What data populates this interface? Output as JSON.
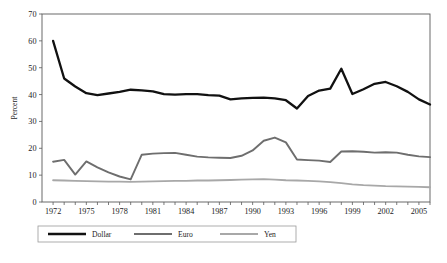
{
  "figure": {
    "caption_fragment": "",
    "background_color": "#ffffff"
  },
  "chart_data": {
    "type": "line",
    "title": "",
    "subtitle": "",
    "xlabel": "",
    "ylabel": "Percent",
    "xlim": [
      1971,
      2006
    ],
    "ylim": [
      0,
      70
    ],
    "ytick_step": 10,
    "yticks": [
      0,
      10,
      20,
      30,
      40,
      50,
      60,
      70
    ],
    "ytick_labels": [
      "0",
      "10",
      "20",
      "30",
      "40",
      "50",
      "60",
      "70"
    ],
    "xticks_all": [
      1972,
      1973,
      1974,
      1975,
      1976,
      1977,
      1978,
      1979,
      1980,
      1981,
      1982,
      1983,
      1984,
      1985,
      1986,
      1987,
      1988,
      1989,
      1990,
      1991,
      1992,
      1993,
      1994,
      1995,
      1996,
      1997,
      1998,
      1999,
      2000,
      2001,
      2002,
      2003,
      2004,
      2005,
      2006
    ],
    "xtick_labels_shown": [
      "1972",
      "1975",
      "1978",
      "1981",
      "1984",
      "1987",
      "1990",
      "1993",
      "1996",
      "1999",
      "2002",
      "2005"
    ],
    "xtick_label_years": [
      1972,
      1975,
      1978,
      1981,
      1984,
      1987,
      1990,
      1993,
      1996,
      1999,
      2002,
      2005
    ],
    "grid": false,
    "legend_position": "below-axes",
    "x": [
      1972,
      1973,
      1974,
      1975,
      1976,
      1977,
      1978,
      1979,
      1980,
      1981,
      1982,
      1983,
      1984,
      1985,
      1986,
      1987,
      1988,
      1989,
      1990,
      1991,
      1992,
      1993,
      1994,
      1995,
      1996,
      1997,
      1998,
      1999,
      2000,
      2001,
      2002,
      2003,
      2004,
      2005,
      2006
    ],
    "series": [
      {
        "name": "Dollar",
        "color": "#111111",
        "width": 2.3,
        "values": [
          60.0,
          46.0,
          43.0,
          40.5,
          39.8,
          40.4,
          41.0,
          41.8,
          41.6,
          41.2,
          40.2,
          40.0,
          40.2,
          40.2,
          39.8,
          39.6,
          38.2,
          38.6,
          38.8,
          38.9,
          38.6,
          37.9,
          34.8,
          39.5,
          41.5,
          42.2,
          49.6,
          40.2,
          42.0,
          44.0,
          44.7,
          43.1,
          41.0,
          38.2,
          36.3
        ]
      },
      {
        "name": "Euro",
        "color": "#6e6e6e",
        "width": 1.9,
        "values": [
          15.0,
          15.7,
          10.2,
          15.1,
          12.9,
          11.0,
          9.5,
          8.4,
          17.6,
          18.0,
          18.2,
          18.3,
          17.6,
          16.9,
          16.6,
          16.5,
          16.4,
          17.2,
          19.2,
          22.8,
          24.0,
          22.2,
          15.8,
          15.6,
          15.4,
          14.9,
          18.8,
          18.9,
          18.7,
          18.4,
          18.5,
          18.4,
          17.6,
          17.0,
          16.7
        ]
      },
      {
        "name": "Yen",
        "color": "#a8a8a8",
        "width": 1.8,
        "values": [
          8.1,
          8.0,
          7.9,
          7.8,
          7.7,
          7.6,
          7.6,
          7.5,
          7.6,
          7.7,
          7.8,
          7.9,
          7.9,
          8.0,
          8.0,
          8.1,
          8.2,
          8.3,
          8.4,
          8.5,
          8.3,
          8.1,
          8.0,
          7.9,
          7.7,
          7.4,
          7.0,
          6.6,
          6.3,
          6.1,
          5.9,
          5.8,
          5.7,
          5.6,
          5.5
        ]
      }
    ],
    "legend": [
      {
        "label": "Dollar",
        "color": "#111111",
        "width": 2.3
      },
      {
        "label": "Euro",
        "color": "#6e6e6e",
        "width": 1.9
      },
      {
        "label": "Yen",
        "color": "#a8a8a8",
        "width": 1.8
      }
    ]
  }
}
